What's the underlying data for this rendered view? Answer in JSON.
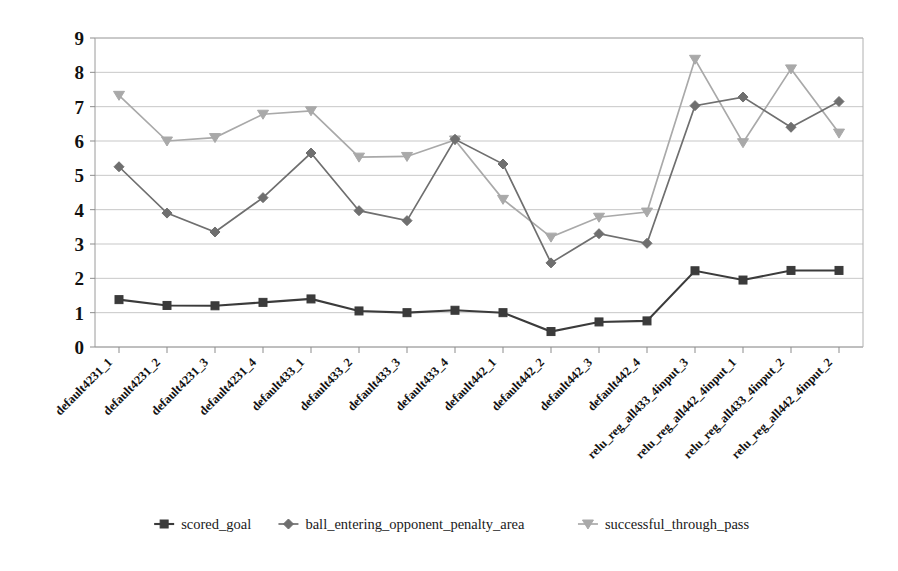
{
  "chart_data": {
    "type": "line",
    "title": "",
    "xlabel": "",
    "ylabel": "",
    "ylim": [
      0,
      9
    ],
    "yticks": [
      0,
      1,
      2,
      3,
      4,
      5,
      6,
      7,
      8,
      9
    ],
    "grid": true,
    "legend_position": "bottom",
    "categories": [
      "default4231_1",
      "default4231_2",
      "default4231_3",
      "default4231_4",
      "default433_1",
      "default433_2",
      "default433_3",
      "default433_4",
      "default442_1",
      "default442_2",
      "default442_3",
      "default442_4",
      "relu_reg_all433_4input_3",
      "relu_reg_all442_4input_1",
      "relu_reg_all433_4input_2",
      "relu_reg_all442_4input_2"
    ],
    "series": [
      {
        "name": "scored_goal",
        "color": "#3b3b3b",
        "marker": "square",
        "values": [
          1.38,
          1.21,
          1.2,
          1.3,
          1.4,
          1.05,
          1.0,
          1.07,
          1.0,
          0.45,
          0.73,
          0.76,
          2.22,
          1.95,
          2.23,
          2.23
        ]
      },
      {
        "name": "ball_entering_opponent_penalty_area",
        "color": "#6f6f6f",
        "marker": "diamond",
        "values": [
          5.25,
          3.9,
          3.35,
          4.35,
          5.65,
          3.97,
          3.68,
          6.05,
          5.33,
          2.45,
          3.3,
          3.02,
          7.03,
          7.28,
          6.4,
          7.15
        ]
      },
      {
        "name": "successful_through_pass",
        "color": "#a9a9a9",
        "marker": "triangle-down",
        "values": [
          7.33,
          6.0,
          6.1,
          6.78,
          6.88,
          5.53,
          5.55,
          6.03,
          4.3,
          3.2,
          3.78,
          3.93,
          8.38,
          5.95,
          8.1,
          6.23
        ]
      }
    ]
  },
  "legend": {
    "items": [
      {
        "label": "scored_goal",
        "color": "#3b3b3b",
        "marker": "square"
      },
      {
        "label": "ball_entering_opponent_penalty_area",
        "color": "#6f6f6f",
        "marker": "diamond"
      },
      {
        "label": "successful_through_pass",
        "color": "#a9a9a9",
        "marker": "triangle-down"
      }
    ]
  },
  "axes": {
    "y_tick_labels": [
      "9",
      "8",
      "7",
      "6",
      "5",
      "4",
      "3",
      "2",
      "1",
      "0"
    ]
  }
}
